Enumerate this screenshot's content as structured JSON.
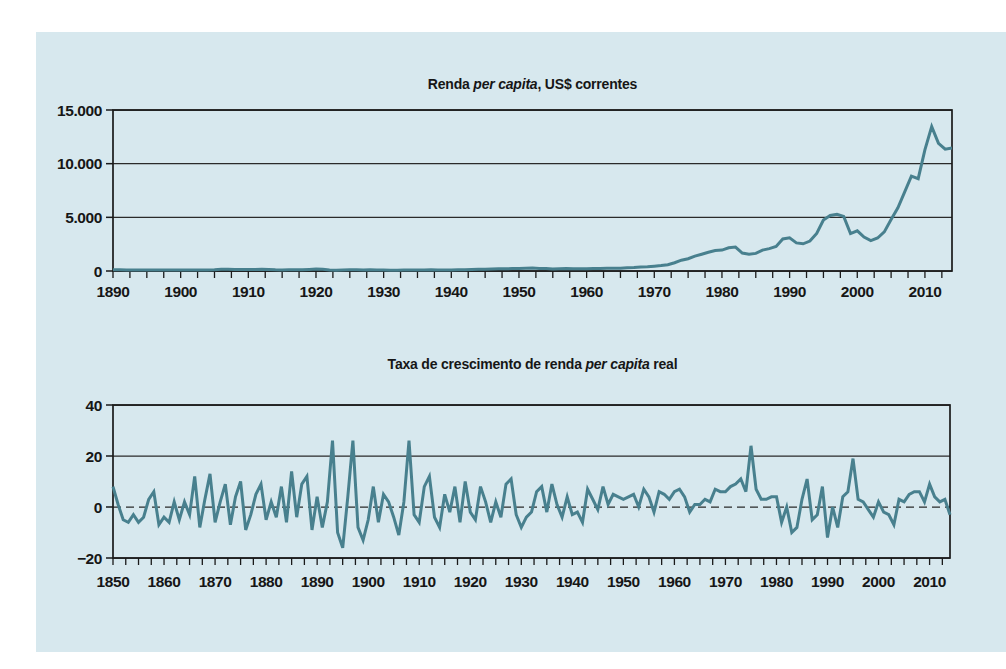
{
  "page": {
    "background": "#ffffff"
  },
  "panel": {
    "background": "#d7e8ee"
  },
  "style": {
    "series_color": "#48808e",
    "axis_color": "#1a1a1a",
    "grid_color": "#2a2a2a",
    "text_color": "#161616"
  },
  "chart_data": [
    {
      "type": "line",
      "title": "Renda per capita, US$ correntes",
      "title_parts": {
        "pre": "Renda ",
        "italic": "per capita",
        "post": ", US$ correntes"
      },
      "xlabel": "",
      "ylabel": "",
      "xlim": [
        1890,
        2014
      ],
      "ylim": [
        0,
        15000
      ],
      "x_start": 1890,
      "x_step": 1,
      "minor_tick_step": 2.5,
      "grid": "horizontal",
      "legend": "none",
      "y_ticks": [
        {
          "value": 0,
          "label": "0",
          "line": "solid"
        },
        {
          "value": 5000,
          "label": "5.000",
          "line": "solid"
        },
        {
          "value": 10000,
          "label": "10.000",
          "line": "solid"
        },
        {
          "value": 15000,
          "label": "15.000",
          "line": "solid"
        }
      ],
      "x_tick_labels": [
        1890,
        1900,
        1910,
        1920,
        1930,
        1940,
        1950,
        1960,
        1970,
        1980,
        1990,
        2000,
        2010
      ],
      "values": [
        120,
        110,
        100,
        95,
        95,
        105,
        105,
        100,
        95,
        90,
        100,
        100,
        95,
        95,
        100,
        110,
        160,
        160,
        150,
        145,
        145,
        150,
        155,
        140,
        115,
        105,
        115,
        125,
        125,
        150,
        180,
        160,
        90,
        70,
        100,
        120,
        110,
        105,
        110,
        105,
        85,
        70,
        75,
        80,
        90,
        90,
        100,
        110,
        100,
        100,
        100,
        110,
        120,
        140,
        160,
        170,
        200,
        215,
        215,
        225,
        235,
        255,
        275,
        235,
        225,
        195,
        210,
        220,
        215,
        205,
        210,
        225,
        235,
        260,
        250,
        260,
        300,
        330,
        370,
        400,
        445,
        505,
        585,
        775,
        1005,
        1150,
        1390,
        1565,
        1745,
        1905,
        1950,
        2165,
        2230,
        1670,
        1560,
        1640,
        1945,
        2085,
        2295,
        2980,
        3090,
        2615,
        2530,
        2790,
        3500,
        4750,
        5170,
        5290,
        5090,
        3480,
        3750,
        3160,
        2830,
        3070,
        3640,
        4790,
        5890,
        7350,
        8830,
        8600,
        11290,
        13450,
        11900,
        11350,
        11450
      ]
    },
    {
      "type": "line",
      "title": "Taxa de crescimento de renda per capita real",
      "title_parts": {
        "pre": "Taxa de crescimento de renda ",
        "italic": "per capita",
        "post": " real"
      },
      "xlabel": "",
      "ylabel": "",
      "xlim": [
        1850,
        2014
      ],
      "ylim": [
        -20,
        40
      ],
      "x_start": 1850,
      "x_step": 1,
      "minor_tick_step": 2.5,
      "grid": "horizontal",
      "legend": "none",
      "y_ticks": [
        {
          "value": -20,
          "label": "−20",
          "line": "solid"
        },
        {
          "value": 0,
          "label": "0",
          "line": "dashed"
        },
        {
          "value": 20,
          "label": "20",
          "line": "solid"
        },
        {
          "value": 40,
          "label": "40",
          "line": "solid"
        }
      ],
      "x_tick_labels": [
        1850,
        1860,
        1870,
        1880,
        1890,
        1900,
        1910,
        1920,
        1930,
        1940,
        1950,
        1960,
        1970,
        1980,
        1990,
        2000,
        2010
      ],
      "values": [
        8,
        1,
        -5,
        -6,
        -3,
        -6,
        -4,
        3,
        6,
        -7,
        -4,
        -6,
        2,
        -5,
        2,
        -3,
        12,
        -8,
        3,
        13,
        -6,
        2,
        9,
        -7,
        4,
        10,
        -9,
        -3,
        5,
        9,
        -5,
        2,
        -4,
        8,
        -6,
        14,
        -4,
        9,
        12,
        -9,
        4,
        -8,
        2,
        26,
        -10,
        -16,
        4,
        26,
        -8,
        -13,
        -5,
        8,
        -6,
        5,
        2,
        -4,
        -11,
        2,
        26,
        -3,
        -6,
        8,
        12,
        -4,
        -8,
        5,
        -2,
        8,
        -6,
        10,
        -2,
        -5,
        8,
        2,
        -6,
        2,
        -4,
        9,
        11,
        -3,
        -8,
        -4,
        -2,
        6,
        8,
        -2,
        9,
        1,
        -4,
        4,
        -3,
        -2,
        -6,
        7,
        3,
        -1,
        8,
        1,
        5,
        4,
        3,
        4,
        5,
        0,
        7,
        4,
        -2,
        6,
        5,
        3,
        6,
        7,
        4,
        -2,
        1,
        1,
        3,
        2,
        7,
        6,
        6,
        8,
        9,
        11,
        6,
        24,
        7,
        3,
        3,
        4,
        4,
        -6,
        0,
        -10,
        -8,
        3,
        11,
        -5,
        -3,
        8,
        -12,
        0,
        -8,
        4,
        6,
        19,
        3,
        2,
        -1,
        -4,
        2,
        -2,
        -3,
        -7,
        3,
        2,
        5,
        6,
        6,
        2,
        9,
        4,
        2,
        3,
        -3
      ]
    }
  ]
}
